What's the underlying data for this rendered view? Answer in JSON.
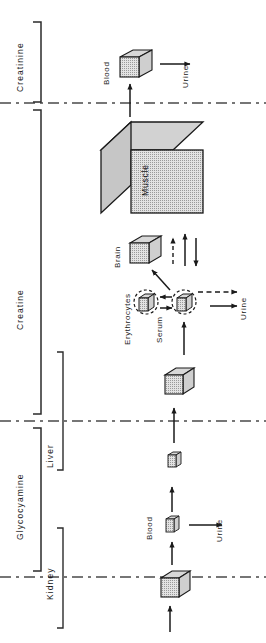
{
  "figure": {
    "orientation": "rotated-90",
    "background": "#ffffff",
    "ink": "#1a1a1a"
  },
  "sections": [
    {
      "id": "creatinine",
      "label": "Creatinine"
    },
    {
      "id": "creatine",
      "label": "Creatine"
    },
    {
      "id": "glycocyamine",
      "label": "Glycocyamine"
    }
  ],
  "organs": [
    {
      "id": "kidney",
      "label": "Kidney"
    },
    {
      "id": "liver",
      "label": "Liver"
    }
  ],
  "compartments": [
    {
      "id": "blood-creatinine",
      "label": "Blood",
      "shape": "cube",
      "size": "small"
    },
    {
      "id": "muscle",
      "label": "Muscle",
      "shape": "cube",
      "size": "large"
    },
    {
      "id": "brain",
      "label": "Brain",
      "shape": "cube",
      "size": "small"
    },
    {
      "id": "erythrocytes",
      "label": "Erythrocytes",
      "shape": "cube-in-dashed-circle",
      "size": "tiny"
    },
    {
      "id": "serum",
      "label": "Serum",
      "shape": "cube-in-dashed-circle",
      "size": "tiny"
    },
    {
      "id": "liver-cube-upper",
      "label": "",
      "shape": "cube",
      "size": "small"
    },
    {
      "id": "liver-cube-lower",
      "label": "",
      "shape": "cube",
      "size": "tiny"
    },
    {
      "id": "blood-glyco",
      "label": "Blood",
      "shape": "cube",
      "size": "tiny"
    },
    {
      "id": "kidney-cube",
      "label": "",
      "shape": "cube",
      "size": "small"
    }
  ],
  "sinks": [
    {
      "id": "urine-creatinine",
      "label": "Urine"
    },
    {
      "id": "urine-creatine",
      "label": "Urine"
    },
    {
      "id": "urine-glycocyamine",
      "label": "Urine"
    }
  ],
  "flows": [
    {
      "from": "muscle",
      "to": "blood-creatinine",
      "style": "solid"
    },
    {
      "from": "blood-creatinine",
      "to": "urine-creatinine",
      "style": "solid"
    },
    {
      "from": "serum",
      "to": "muscle",
      "style": "dashed"
    },
    {
      "from": "muscle",
      "to": "serum",
      "style": "solid"
    },
    {
      "from": "serum",
      "to": "brain",
      "style": "solid"
    },
    {
      "from": "serum",
      "to": "erythrocytes",
      "style": "solid"
    },
    {
      "from": "erythrocytes",
      "to": "serum",
      "style": "solid"
    },
    {
      "from": "serum",
      "to": "urine-creatine",
      "style": "dashed"
    },
    {
      "from": "serum",
      "to": "urine-creatine",
      "style": "solid"
    },
    {
      "from": "liver-cube-upper",
      "to": "serum",
      "style": "solid"
    },
    {
      "from": "liver-cube-lower",
      "to": "liver-cube-upper",
      "style": "solid"
    },
    {
      "from": "blood-glyco",
      "to": "liver-cube-lower",
      "style": "solid"
    },
    {
      "from": "kidney-cube",
      "to": "blood-glyco",
      "style": "solid"
    },
    {
      "from": "blood-glyco",
      "to": "urine-glycocyamine",
      "style": "solid"
    },
    {
      "from": "external",
      "to": "kidney-cube",
      "style": "solid"
    }
  ],
  "dividers": [
    {
      "id": "divider-creatinine-creatine",
      "style": "dash-dot"
    },
    {
      "id": "divider-creatine-glycocyamine",
      "style": "dash-dot"
    },
    {
      "id": "divider-glycocyamine-kidney",
      "style": "dash-dot"
    }
  ]
}
